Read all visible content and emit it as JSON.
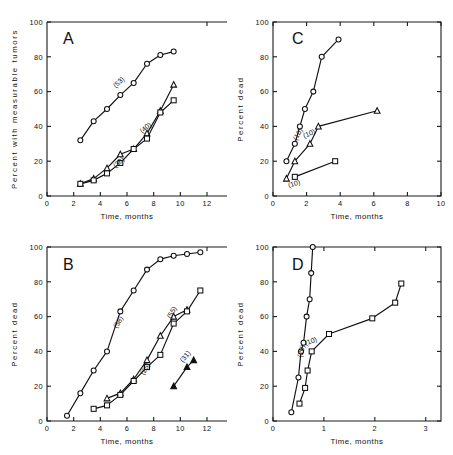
{
  "figure": {
    "background": "#ffffff",
    "ink": "#101010",
    "width": 453,
    "height": 455
  },
  "chart_data": [
    {
      "type": "line",
      "panel": "A",
      "title": "A",
      "xlabel": "Time, months",
      "ylabel": "Percent with measurable tumors",
      "xlim": [
        0,
        12
      ],
      "ylim": [
        0,
        100
      ],
      "xticks": [
        0,
        2,
        4,
        6,
        8,
        10,
        12
      ],
      "xticklabels": [
        "0",
        "2",
        "4",
        "6",
        "8",
        "10",
        "12"
      ],
      "yticks": [
        0,
        20,
        40,
        60,
        80,
        100
      ],
      "yticklabels": [
        "0",
        "20",
        "40",
        "60",
        "80",
        "100"
      ],
      "grid": false,
      "legend": "inline-annotation",
      "frame": "open",
      "series": [
        {
          "name": "(53)",
          "label": "(53)",
          "marker": "circle-open",
          "x": [
            2.5,
            3.5,
            4.5,
            5.5,
            6.5,
            7.5,
            8.5,
            9.5
          ],
          "y": [
            32,
            43,
            50,
            58,
            65,
            76,
            81,
            83
          ]
        },
        {
          "name": "(38)",
          "label": "(38)",
          "marker": "triangle-open",
          "x": [
            2.5,
            3.5,
            4.5,
            5.5,
            6.5,
            7.5,
            8.5,
            9.5
          ],
          "y": [
            7,
            10,
            16,
            24,
            27,
            36,
            49,
            64
          ]
        },
        {
          "name": "(40)",
          "label": "(40)",
          "marker": "square-open",
          "x": [
            2.5,
            3.5,
            4.5,
            5.5,
            6.5,
            7.5,
            8.5,
            9.5
          ],
          "y": [
            7,
            9,
            13,
            19,
            27,
            33,
            48,
            55
          ]
        }
      ]
    },
    {
      "type": "line",
      "panel": "B",
      "title": "B",
      "xlabel": "Time, months",
      "ylabel": "Percent dead",
      "xlim": [
        0,
        12
      ],
      "ylim": [
        0,
        100
      ],
      "xticks": [
        0,
        2,
        4,
        6,
        8,
        10,
        12
      ],
      "xticklabels": [
        "0",
        "2",
        "4",
        "6",
        "8",
        "10",
        "12"
      ],
      "yticks": [
        0,
        20,
        40,
        60,
        80,
        100
      ],
      "yticklabels": [
        "0",
        "20",
        "40",
        "60",
        "80",
        "100"
      ],
      "grid": false,
      "legend": "inline-annotation",
      "frame": "open",
      "series": [
        {
          "name": "(58)",
          "label": "(58)",
          "marker": "circle-open",
          "x": [
            1.5,
            2.5,
            3.5,
            4.5,
            5.5,
            6.5,
            7.5,
            8.5,
            9.5,
            10.5,
            11.5
          ],
          "y": [
            3,
            16,
            29,
            40,
            63,
            75,
            87,
            93,
            95,
            96,
            97
          ]
        },
        {
          "name": "(25)",
          "label": "(25)",
          "marker": "triangle-open",
          "x": [
            4.5,
            5.5,
            6.5,
            7.5,
            8.5,
            9.5,
            10.5
          ],
          "y": [
            13,
            16,
            24,
            35,
            49,
            60,
            64
          ]
        },
        {
          "name": "(55)",
          "label": "(55)",
          "marker": "square-open",
          "x": [
            3.5,
            4.5,
            5.5,
            6.5,
            7.5,
            8.5,
            9.5,
            10.5,
            11.5
          ],
          "y": [
            7,
            9,
            15,
            23,
            31,
            38,
            56,
            63,
            75
          ]
        },
        {
          "name": "(31)",
          "label": "(31)",
          "marker": "triangle-filled",
          "x": [
            9.5,
            10.5,
            11.0
          ],
          "y": [
            20,
            31,
            35
          ]
        }
      ]
    },
    {
      "type": "line",
      "panel": "C",
      "title": "C",
      "xlabel": "Time, months",
      "ylabel": "Percent dead",
      "xlim": [
        0,
        10
      ],
      "ylim": [
        0,
        100
      ],
      "xticks": [
        0,
        2,
        4,
        6,
        8,
        10
      ],
      "xticklabels": [
        "0",
        "2",
        "4",
        "6",
        "8",
        "10"
      ],
      "yticks": [
        0,
        20,
        40,
        60,
        80,
        100
      ],
      "yticklabels": [
        "0",
        "20",
        "40",
        "60",
        "80",
        "100"
      ],
      "grid": false,
      "legend": "inline-annotation",
      "frame": "box",
      "series": [
        {
          "name": "(10) upper",
          "label": "(10)",
          "marker": "circle-open",
          "x": [
            0.8,
            1.3,
            1.6,
            1.9,
            2.4,
            2.9,
            3.9
          ],
          "y": [
            20,
            30,
            40,
            50,
            60,
            80,
            90
          ]
        },
        {
          "name": "(10) middle",
          "label": "(10)",
          "marker": "triangle-open",
          "x": [
            0.8,
            1.3,
            2.2,
            2.7,
            6.2
          ],
          "y": [
            10,
            20,
            30,
            40,
            49
          ]
        },
        {
          "name": "(10) lower",
          "label": "(10)",
          "marker": "square-open",
          "x": [
            1.3,
            3.7
          ],
          "y": [
            11,
            20
          ]
        }
      ]
    },
    {
      "type": "line",
      "panel": "D",
      "title": "D",
      "xlabel": "Time, months",
      "ylabel": "Percent dead",
      "xlim": [
        0,
        3.3
      ],
      "ylim": [
        0,
        100
      ],
      "xticks": [
        0,
        1,
        2,
        3
      ],
      "xticklabels": [
        "0",
        "1",
        "2",
        "3"
      ],
      "yticks": [
        0,
        20,
        40,
        60,
        80,
        100
      ],
      "yticklabels": [
        "0",
        "20",
        "40",
        "60",
        "80",
        "100"
      ],
      "grid": false,
      "legend": "inline-annotation",
      "frame": "box",
      "series": [
        {
          "name": "(20)",
          "label": "(20)",
          "marker": "circle-open",
          "x": [
            0.36,
            0.5,
            0.55,
            0.6,
            0.66,
            0.72,
            0.75,
            0.78
          ],
          "y": [
            5,
            25,
            40,
            45,
            60,
            70,
            85,
            100
          ]
        },
        {
          "name": "(10)",
          "label": "(10)",
          "marker": "square-open",
          "x": [
            0.52,
            0.63,
            0.68,
            0.76,
            1.1,
            1.95,
            2.4,
            2.52
          ],
          "y": [
            10,
            19,
            29,
            40,
            50,
            59,
            68,
            79
          ]
        }
      ]
    }
  ]
}
